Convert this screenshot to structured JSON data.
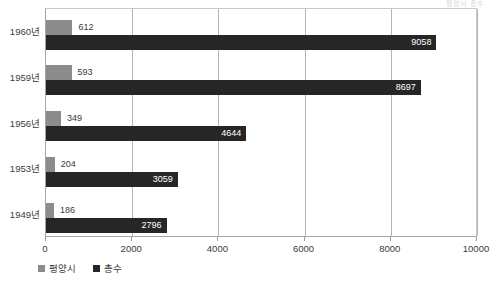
{
  "clipped_header_text": "평양시 총수",
  "chart_data": {
    "type": "bar",
    "orientation": "horizontal",
    "title": "",
    "subtitle": "",
    "xlabel": "",
    "ylabel": "",
    "categories": [
      "1949년",
      "1953년",
      "1956년",
      "1959년",
      "1960년"
    ],
    "categories_top_to_bottom": [
      "1960년",
      "1959년",
      "1956년",
      "1953년",
      "1949년"
    ],
    "series": [
      {
        "name": "평양시",
        "color": "#8c8c8c",
        "values": [
          186,
          204,
          349,
          593,
          612
        ]
      },
      {
        "name": "총수",
        "color": "#262626",
        "values": [
          2796,
          3059,
          4644,
          8697,
          9058
        ]
      }
    ],
    "xlim": [
      0,
      10000
    ],
    "xticks": [
      0,
      2000,
      4000,
      6000,
      8000,
      10000
    ],
    "xtick_labels": [
      "0",
      "2000",
      "4000",
      "6000",
      "8000",
      "10000"
    ],
    "grid": true,
    "grid_axis": "x",
    "legend_position": "bottom-left",
    "data_labels": true
  },
  "legend": {
    "items": [
      {
        "label": "평양시",
        "color": "#8c8c8c"
      },
      {
        "label": "총수",
        "color": "#262626"
      }
    ]
  },
  "colors": {
    "series_city": "#8c8c8c",
    "series_total": "#262626",
    "gridline": "#b4b4b4",
    "axis": "#a6a6a6",
    "text": "#3a3a3a",
    "background": "#ffffff"
  }
}
